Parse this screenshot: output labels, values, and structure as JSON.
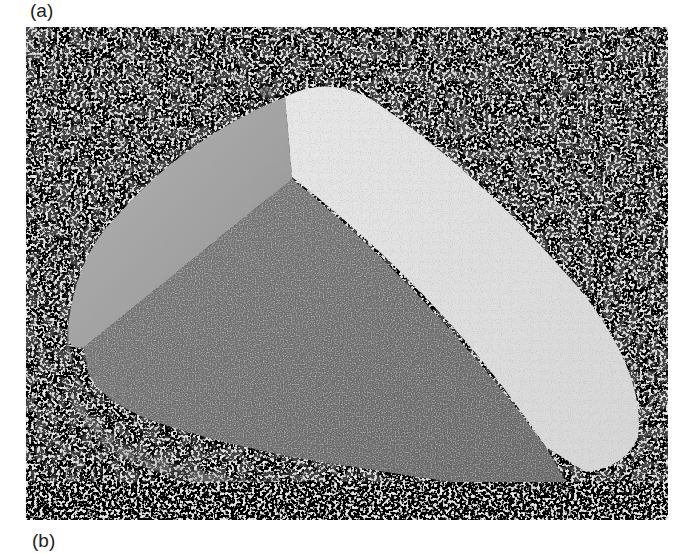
{
  "figure": {
    "panel_labels": {
      "top": "(a)",
      "bottom": "(b)"
    },
    "photo": {
      "subject": "faceted wind-abraded rock (ventifact) resting on gravel",
      "style": "grayscale photograph",
      "colors": {
        "gravel_light": "#e6e6e6",
        "gravel_speck": "#6e6e6e",
        "facet_dark": "#6f6f6f",
        "facet_mid": "#a8a8a8",
        "facet_light": "#e2e2e2"
      }
    }
  }
}
